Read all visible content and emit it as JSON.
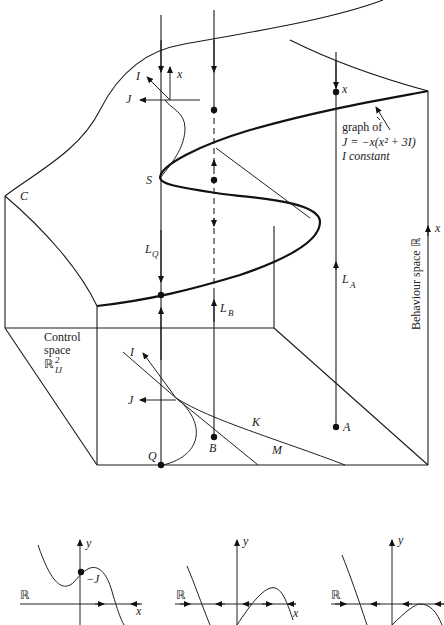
{
  "figure": {
    "main_diagram": {
      "labels": {
        "C": "C",
        "S": "S",
        "Q": "Q",
        "B": "B",
        "A": "A",
        "K": "K",
        "M": "M",
        "L_Q": "L",
        "L_Q_sub": "Q",
        "L_B": "L",
        "L_B_sub": "B",
        "L_A": "L",
        "L_A_sub": "A",
        "x_top": "x",
        "x_right_top": "x",
        "x_behaviour": "x",
        "I_top": "I",
        "J_top": "J",
        "I_bottom": "I",
        "J_bottom": "J"
      },
      "annotation": {
        "line1": "graph of",
        "line2": "J = −x(x² + 3I)",
        "line3": "I constant"
      },
      "control_space": {
        "line1": "Control",
        "line2": "space",
        "symbol": "ℝ",
        "sup": "2",
        "sub": "IJ"
      },
      "behaviour_space": {
        "label": "Behaviour space  ℝ"
      }
    },
    "small_plots": [
      {
        "y_label": "y",
        "x_label": "x",
        "space_label": "ℝ",
        "point_label": "−J"
      },
      {
        "y_label": "y",
        "x_label": "x",
        "space_label": "ℝ"
      },
      {
        "y_label": "y",
        "x_label": "",
        "space_label": "ℝ"
      }
    ]
  }
}
